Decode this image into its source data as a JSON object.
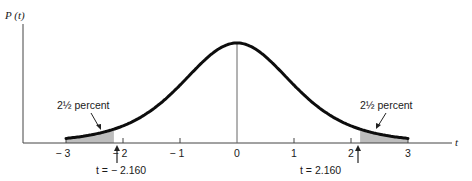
{
  "chart_data": {
    "type": "line",
    "title": "",
    "xlabel": "t",
    "ylabel": "P (t)",
    "xlim": [
      -3,
      3
    ],
    "x_ticks": [
      -3,
      -2,
      -1,
      0,
      1,
      2,
      3
    ],
    "x_tick_labels": [
      "− 3",
      "− 2",
      "− 1",
      "0",
      "1",
      "2",
      "3"
    ],
    "grid": false,
    "legend": "none",
    "series": [
      {
        "name": "t-distribution density",
        "distribution": "Student t",
        "description": "Bell-shaped density centered at t = 0, peak P(t) approx 0.39 (normalized height 1.0), tails approach zero at t = ±3"
      }
    ],
    "shaded_regions": [
      {
        "from": -3,
        "to": -2.16,
        "area_label": "2½ percent",
        "color": "#bdbdbd"
      },
      {
        "from": 2.16,
        "to": 3,
        "area_label": "2½ percent",
        "color": "#bdbdbd"
      }
    ],
    "annotations": [
      {
        "text": "2½ percent",
        "points_to": "left tail area"
      },
      {
        "text": "2½ percent",
        "points_to": "right tail area"
      },
      {
        "text": "t = − 2.160",
        "arrow_at": -2.16
      },
      {
        "text": "t = 2.160",
        "arrow_at": 2.16
      }
    ],
    "center_line_at": 0
  },
  "labels": {
    "y_axis": "P (t)",
    "x_axis": "t",
    "left_tail": "2½ percent",
    "right_tail": "2½ percent",
    "left_critical": "t = − 2.160",
    "right_critical": "t = 2.160"
  },
  "colors": {
    "curve": "#0d0d0d",
    "axis": "#444444",
    "shade": "#bdbdbd",
    "text": "#1a1a1a"
  }
}
